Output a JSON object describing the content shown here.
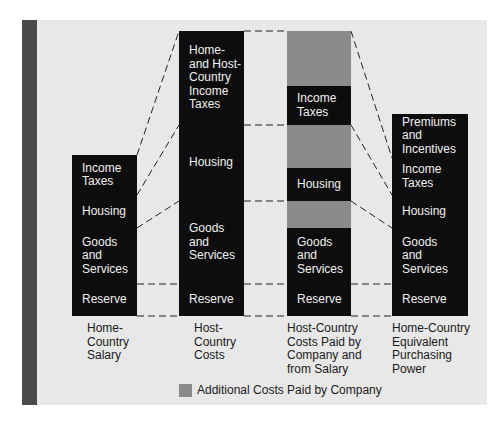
{
  "colors": {
    "panel_background": "#e8e8e8",
    "stripe": "#4a4a4a",
    "bar_black": "#0d0d0d",
    "additional_cost_gray": "#8b8b8b",
    "text_on_bar": "#f0f0f0",
    "caption_text": "#1a1a1a"
  },
  "columns": [
    {
      "id": "home-country-salary",
      "caption": "Home-\nCountry\nSalary",
      "segments": [
        {
          "label": "Income\nTaxes",
          "type": "black"
        },
        {
          "label": "Housing",
          "type": "black"
        },
        {
          "label": "Goods\nand\nServices",
          "type": "black"
        },
        {
          "label": "Reserve",
          "type": "black"
        }
      ]
    },
    {
      "id": "host-country-costs",
      "caption": "Host-\nCountry\nCosts",
      "segments": [
        {
          "label": "Home-\nand Host-\nCountry\nIncome\nTaxes",
          "type": "black"
        },
        {
          "label": "Housing",
          "type": "black"
        },
        {
          "label": "Goods\nand\nServices",
          "type": "black"
        },
        {
          "label": "Reserve",
          "type": "black"
        }
      ]
    },
    {
      "id": "host-country-costs-paid",
      "caption": "Host-Country\nCosts Paid by\nCompany and\nfrom Salary",
      "segments": [
        {
          "label": "",
          "type": "gray"
        },
        {
          "label": "Income\nTaxes",
          "type": "black"
        },
        {
          "label": "",
          "type": "gray"
        },
        {
          "label": "Housing",
          "type": "black"
        },
        {
          "label": "",
          "type": "gray"
        },
        {
          "label": "Goods\nand\nServices",
          "type": "black"
        },
        {
          "label": "Reserve",
          "type": "black"
        }
      ]
    },
    {
      "id": "home-country-equivalent",
      "caption": "Home-Country\nEquivalent\nPurchasing\nPower",
      "segments": [
        {
          "label": "Premiums\nand\nIncentives",
          "type": "black"
        },
        {
          "label": "Income\nTaxes",
          "type": "black"
        },
        {
          "label": "Housing",
          "type": "black"
        },
        {
          "label": "Goods\nand\nServices",
          "type": "black"
        },
        {
          "label": "Reserve",
          "type": "black"
        }
      ]
    }
  ],
  "legend": {
    "label": "Additional Costs Paid by Company",
    "swatch_color": "#8b8b8b"
  }
}
